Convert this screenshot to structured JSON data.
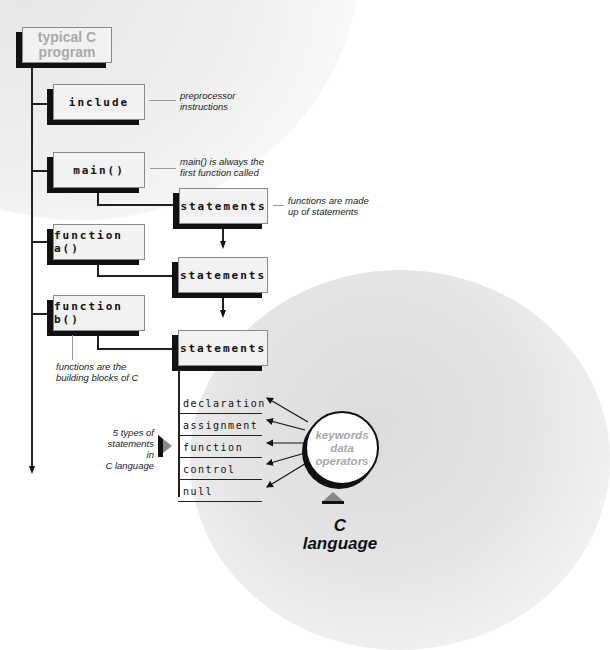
{
  "diagram": {
    "title": {
      "line1": "typical C",
      "line2": "program"
    },
    "boxes": {
      "include": "include",
      "main": "main()",
      "function_a": "function a()",
      "function_b": "function b()",
      "statements_1": "statements",
      "statements_2": "statements",
      "statements_3": "statements"
    },
    "notes": {
      "include": {
        "line1": "preprocessor",
        "line2": "instructions"
      },
      "main": {
        "line1": "main() is always the",
        "line2": "first function called"
      },
      "statements": {
        "line1": "functions are made",
        "line2": "up of statements"
      },
      "function_b": {
        "line1": "functions are the",
        "line2": "building blocks of C"
      },
      "statement_types": {
        "line1": "5 types of",
        "line2": "statements in",
        "line3": "C language"
      }
    },
    "statement_types": [
      "declaration",
      "assignment",
      "function",
      "control",
      "null"
    ],
    "circle": {
      "line1": "keywords",
      "line2": "data",
      "line3": "operators"
    },
    "footer": {
      "line1": "C",
      "line2": "language"
    },
    "colors": {
      "shadow": "#111111",
      "box_fill": "#f2f2f2",
      "title_text": "#a9a9a9"
    }
  }
}
